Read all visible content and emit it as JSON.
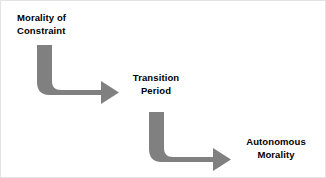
{
  "diagram": {
    "title_text": "Morality of Constraint → Transition Period → Autonomous Morality",
    "background_color": "#ffffff",
    "arrow_color": "#808080",
    "text_color": "#000000",
    "stages": [
      {
        "id": "morality-of-constraint",
        "label": "Morality of\nConstraint",
        "align": "left"
      },
      {
        "id": "transition-period",
        "label": "Transition\nPeriod",
        "align": "center"
      },
      {
        "id": "autonomous-morality",
        "label": "Autonomous\nMorality",
        "align": "center"
      }
    ],
    "connectors": [
      {
        "id": "connector-constraint-to-transition",
        "shape": "elbow-arrow-down-right",
        "from": "morality-of-constraint",
        "to": "transition-period"
      },
      {
        "id": "connector-transition-to-autonomous",
        "shape": "elbow-arrow-down-right",
        "from": "transition-period",
        "to": "autonomous-morality"
      }
    ]
  }
}
